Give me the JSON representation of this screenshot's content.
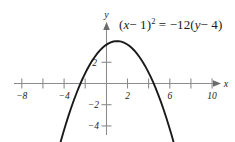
{
  "figure": {
    "background_color": "#ffffff",
    "width": 235,
    "height": 142,
    "equation_parts": {
      "lead": "(",
      "var_x": "x",
      "minus_one": "− 1",
      "close_paren": ")",
      "exponent": "2",
      "equals": " = ",
      "rhs_coefficient": "−12(",
      "var_y": "y",
      "minus_four": "− 4",
      "rhs_close": ")"
    },
    "equation_plain": "(x − 1)² = −12(y − 4)"
  },
  "axes": {
    "x_axis_label": "x",
    "y_axis_label": "y",
    "x_tick_labels": [
      "−8",
      "−4",
      "2",
      "6",
      "10"
    ],
    "y_tick_labels": [
      "2",
      "−2",
      "−4"
    ],
    "axis_color": "#8c8c8c",
    "curve_color": "#1a1a1a"
  },
  "chart_data": {
    "type": "line",
    "title": "",
    "subtitle": "",
    "xlabel": "x",
    "ylabel": "y",
    "annotation": "(x − 1)² = −12(y − 4)",
    "equation": "(x-1)^2 = -12(y-4)",
    "vertex": [
      1,
      4
    ],
    "opens": "down",
    "focal_parameter_4p": -12,
    "x_intercepts": [
      -6.93,
      8.93
    ],
    "y_intercept": 3.9167,
    "xlim": [
      -9.8,
      11.2
    ],
    "ylim": [
      -5.2,
      5.0
    ],
    "grid": false,
    "legend": null,
    "x_ticks": [
      -8,
      -6,
      -4,
      -2,
      2,
      4,
      6,
      8,
      10
    ],
    "x_ticks_labeled": [
      -8,
      -4,
      2,
      6,
      10
    ],
    "y_ticks": [
      2,
      -2,
      -4
    ],
    "y_ticks_labeled": [
      2,
      -2,
      -4
    ],
    "series": [
      {
        "name": "parabola",
        "x": [
          -9.0,
          -8.5,
          -8.0,
          -7.5,
          -7.0,
          -6.5,
          -6.0,
          -5.5,
          -5.0,
          -4.5,
          -4.0,
          -3.5,
          -3.0,
          -2.5,
          -2.0,
          -1.5,
          -1.0,
          -0.5,
          0.0,
          0.5,
          1.0,
          1.5,
          2.0,
          2.5,
          3.0,
          3.5,
          4.0,
          4.5,
          5.0,
          5.5,
          6.0,
          6.5,
          7.0,
          7.5,
          8.0,
          8.5,
          9.0,
          9.5,
          10.0,
          10.5,
          11.0
        ],
        "y": [
          -4.333,
          -3.688,
          -3.083,
          -2.521,
          -2.0,
          -1.521,
          -1.083,
          -0.688,
          -0.333,
          -0.021,
          0.25,
          0.479,
          0.667,
          0.813,
          0.917,
          0.979,
          0.667,
          3.813,
          3.917,
          3.979,
          4.0,
          3.979,
          3.917,
          3.813,
          3.667,
          3.479,
          3.25,
          2.979,
          2.667,
          2.313,
          1.917,
          1.479,
          1.0,
          0.479,
          -0.083,
          -0.688,
          -1.333,
          -2.021,
          -2.75,
          -3.521,
          -4.333
        ]
      }
    ]
  }
}
